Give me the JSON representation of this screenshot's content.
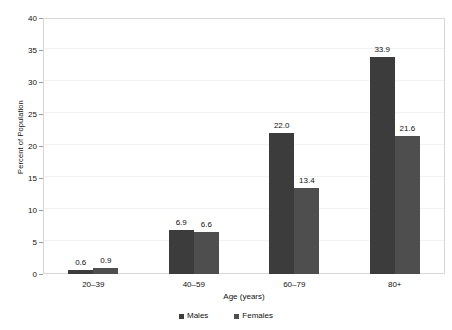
{
  "chart_data": {
    "type": "bar",
    "title": "",
    "subtitle": "",
    "xlabel": "Age (years)",
    "ylabel": "Percent of Population",
    "categories": [
      "20–39",
      "40–59",
      "60–79",
      "80+"
    ],
    "series": [
      {
        "name": "Males",
        "color": "#3c3c3c",
        "values": [
          0.6,
          6.9,
          22.0,
          33.9
        ],
        "labels": [
          "0.6",
          "6.9",
          "22.0",
          "33.9"
        ]
      },
      {
        "name": "Females",
        "color": "#4e4e4e",
        "values": [
          0.9,
          6.6,
          13.4,
          21.6
        ],
        "labels": [
          "0.9",
          "6.6",
          "13.4",
          "21.6"
        ]
      }
    ],
    "ylim": [
      0,
      40
    ],
    "yticks": [
      0,
      5,
      10,
      15,
      20,
      25,
      30,
      35,
      40
    ],
    "ytick_labels": [
      "0",
      "5",
      "10",
      "15",
      "20",
      "25",
      "30",
      "35",
      "40"
    ],
    "grid": true,
    "grid_axis": "y",
    "legend_position": "bottom-center",
    "frame": true,
    "value_labels_shown": true
  },
  "legend": {
    "items": [
      {
        "label": "Males",
        "color": "#3c3c3c"
      },
      {
        "label": "Females",
        "color": "#4e4e4e"
      }
    ]
  },
  "axes": {
    "y_title": "Percent of Population",
    "x_title": "Age (years)"
  }
}
